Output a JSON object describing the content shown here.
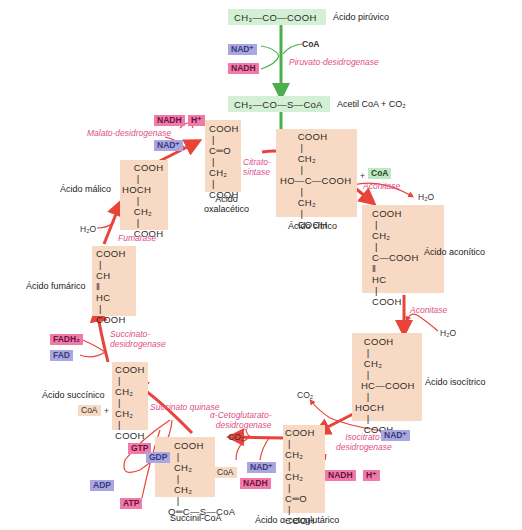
{
  "colors": {
    "molecule_bg": "#f8d9c4",
    "acetyl_bg": "#d3f0d5",
    "main_arrow": "#e8443a",
    "green_arrow": "#4cae4c",
    "enzyme_text": "#e0508a",
    "nad_tag": "#a9a6e2",
    "nadh_tag": "#f07aa8"
  },
  "pyruvate": {
    "formula": "CH₃—CO—COOH",
    "name": "Ácido pirúvico",
    "enzyme": "Piruvato-desidrogenase",
    "inputs": [
      "NAD⁺",
      "CoA"
    ],
    "outputs": [
      "NADH"
    ]
  },
  "acetyl_coa": {
    "formula": "CH₃—CO—S—CoA",
    "name": "Acetil CoA + CO₂"
  },
  "citric": {
    "formula": "      COOH\n       |\n      CH₂\n       |\nHO—C—COOH\n       |\n      CH₂\n       |\n      COOH",
    "name": "Ácido cítrico",
    "byproduct": "CoA",
    "plus": "+"
  },
  "aconitic": {
    "formula": "COOH\n |\nCH₂\n |\nC—COOH\n‖\nHC\n |\nCOOH",
    "name": "Ácido aconítico",
    "enzyme_in": "Aconitase",
    "water_out": "H₂O",
    "enzyme_out": "Aconitase",
    "water_in": "H₂O"
  },
  "isocitric": {
    "formula": "   COOH\n    |\n   CH₂\n    |\n  HC—COOH\n    |\nHOCH\n    |\n   COOH",
    "name": "Ácido isocítrico",
    "enzyme": "Isocitrato-\ndesidrogenase",
    "co2": "CO₂",
    "nad": "NAD⁺",
    "nadh": "NADH",
    "h": "H⁺"
  },
  "ketoglutaric": {
    "formula": "COOH\n |\nCH₂\n |\nCH₂\n |\nC═O\n |\nCOOH",
    "name": "Ácido α-cetoglutárico",
    "enzyme": "α-Cetoglutarato-\ndesidrogenase",
    "co2": "CO₂",
    "coa": "CoA",
    "nad": "NAD⁺",
    "nadh": "NADH"
  },
  "succinyl_coa": {
    "formula": "  COOH\n   |\n  CH₂\n   |\n  CH₂\n   |\nO═C—S—CoA",
    "name": "Succinil-CoA",
    "enzyme": "Succinato quinase",
    "gtp": "GTP",
    "gdp": "GDP",
    "adp": "ADP",
    "atp": "ATP"
  },
  "succinic": {
    "formula": "COOH\n |\nCH₂\n |\nCH₂\n |\nCOOH",
    "name": "Ácido succínico",
    "coa": "CoA",
    "plus": "+",
    "enzyme": "Succinato-\ndesidrogenase",
    "fadh2": "FADH₂",
    "fad": "FAD"
  },
  "fumaric": {
    "formula": "COOH\n |\nCH\n‖\nHC\n |\nCOOH",
    "name": "Ácido fumárico",
    "enzyme": "Fumarase",
    "water": "H₂O"
  },
  "malic": {
    "formula: ": "",
    "formula": "    COOH\n     |\nHOCH\n     |\n    CH₂\n     |\n    COOH",
    "name": "Ácido málico",
    "enzyme": "Malato-desidrogenase",
    "nadh": "NADH",
    "h": "H⁺",
    "nad": "NAD⁺"
  },
  "oxaloacetic": {
    "formula": "COOH\n |\nC═O\n |\nCH₂\n |\nCOOH",
    "name": "Ácido\noxalacético",
    "enzyme": "Citrato-\nsintase"
  }
}
